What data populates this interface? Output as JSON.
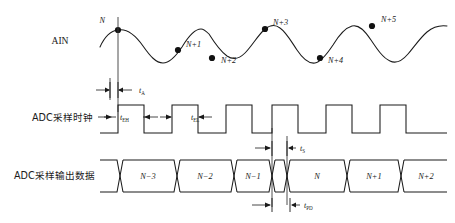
{
  "figure": {
    "colors": {
      "ink": "#1a1a1a",
      "guide": "#3a3a3a",
      "background": "#ffffff"
    }
  },
  "rows": {
    "analog": {
      "label": "AIN",
      "label_x": 60,
      "label_y": 44,
      "sample_points": [
        {
          "name": "N",
          "cx": 118,
          "cy": 30,
          "lx": 105,
          "ly": 23
        },
        {
          "name": "N+1",
          "cx": 178,
          "cy": 50,
          "lx": 186,
          "ly": 47
        },
        {
          "name": "N+2",
          "cx": 212,
          "cy": 58,
          "lx": 221,
          "ly": 63
        },
        {
          "name": "N+3",
          "cx": 265,
          "cy": 29,
          "lx": 273,
          "ly": 25
        },
        {
          "name": "N+4",
          "cx": 320,
          "cy": 58,
          "lx": 328,
          "ly": 63
        },
        {
          "name": "N+5",
          "cx": 372,
          "cy": 26,
          "lx": 381,
          "ly": 22
        }
      ]
    },
    "clock": {
      "label": "ADC采样时钟",
      "label_x": 32,
      "label_y": 118,
      "arrow_from_x": 98,
      "arrow_to_x": 112,
      "arrow_y": 117,
      "high_time_label": {
        "name": "t",
        "sub": "EH",
        "x": 117,
        "y": 120
      },
      "low_time_label": {
        "name": "t",
        "sub": "EL",
        "x": 188,
        "y": 120
      }
    },
    "data": {
      "label": "ADC采样输出数据",
      "label_x": 14,
      "label_y": 176,
      "cells": [
        {
          "value": "N−3",
          "cx": 148
        },
        {
          "value": "N−2",
          "cx": 205
        },
        {
          "value": "N−1",
          "cx": 258
        },
        {
          "value": "N",
          "cx": 317
        },
        {
          "value": "N+1",
          "cx": 374
        },
        {
          "value": "N+2",
          "cx": 427
        }
      ]
    }
  },
  "annotations": [
    {
      "id": "t-aperture",
      "name": "t",
      "sub": "A",
      "label_x": 139,
      "label_y": 93
    },
    {
      "id": "t-settling",
      "name": "t",
      "sub": "S",
      "label_x": 300,
      "label_y": 150
    },
    {
      "id": "t-propagation",
      "name": "t",
      "sub": "PD",
      "label_x": 304,
      "label_y": 210
    }
  ],
  "icon_names": {
    "arrow": "arrow-right-icon",
    "dimension": "dimension-arrow-icon",
    "dot": "sample-point-dot-icon"
  }
}
